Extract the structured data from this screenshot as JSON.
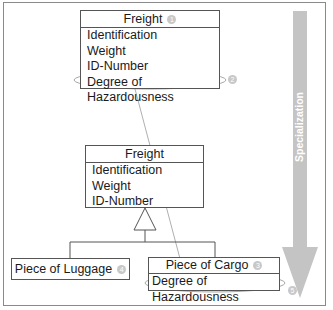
{
  "diagram": {
    "top_class": {
      "name": "Freight",
      "badge": "1",
      "attributes": [
        "Identification",
        "Weight",
        "ID-Number",
        "Degree of Hazardousness"
      ],
      "attribute_badge": "2"
    },
    "base_class": {
      "name": "Freight",
      "attributes": [
        "Identification",
        "Weight",
        "ID-Number"
      ]
    },
    "subclasses": [
      {
        "name": "Piece of Luggage",
        "badge": "4"
      },
      {
        "name": "Piece of Cargo",
        "badge": "3",
        "attributes": [
          "Degree of Hazardousness"
        ],
        "attribute_badge": "5"
      }
    ],
    "arrow": {
      "label": "Specialization",
      "color": "#c4c4c4"
    },
    "highlight_color": "#a8a8a8"
  }
}
